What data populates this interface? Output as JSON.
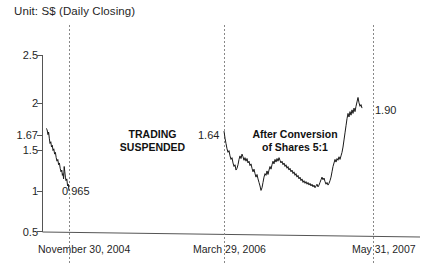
{
  "chart_data": {
    "type": "line",
    "title": "Unit: S$ (Daily Closing)",
    "xlabel": "",
    "ylabel": "",
    "ylim": [
      0.5,
      2.5
    ],
    "yticks": [
      0.5,
      1,
      1.5,
      1.67,
      2,
      2.5
    ],
    "ytick_labels": [
      "0.5",
      "1",
      "1.5",
      "1.67",
      "2",
      "2.5"
    ],
    "xtick_labels": [
      "November 30, 2004",
      "March 29, 2006",
      "May 31, 2007"
    ],
    "grid": false,
    "legend": "none",
    "vertical_markers": [
      {
        "label": "November 30, 2004",
        "x_px": 69
      },
      {
        "label": "March 29, 2006",
        "x_px": 224
      },
      {
        "label": "May 31, 2007",
        "x_px": 373
      }
    ],
    "annotations": [
      {
        "text": "TRADING SUSPENDED",
        "line1": "TRADING",
        "line2": "SUSPENDED",
        "bold": true
      },
      {
        "text": "After Conversion of Shares 5:1",
        "line1": "After Conversion",
        "line2": "of Shares 5:1",
        "bold": true
      },
      {
        "text": "0.965",
        "value": 0.965
      },
      {
        "text": "1.64",
        "value": 1.64
      },
      {
        "text": "1.90",
        "value": 1.9
      }
    ],
    "series": [
      {
        "name": "Pre-suspension (to November 30, 2004)",
        "start_value": 1.67,
        "end_value": 0.965,
        "points": [
          [
            46,
            1.67
          ],
          [
            47,
            1.66
          ],
          [
            48,
            1.6
          ],
          [
            48.6,
            1.63
          ],
          [
            49.3,
            1.56
          ],
          [
            50,
            1.5
          ],
          [
            50.8,
            1.52
          ],
          [
            51.5,
            1.46
          ],
          [
            52.3,
            1.48
          ],
          [
            53,
            1.42
          ],
          [
            53.8,
            1.44
          ],
          [
            54.6,
            1.38
          ],
          [
            55.4,
            1.4
          ],
          [
            56.2,
            1.34
          ],
          [
            57,
            1.3
          ],
          [
            57.8,
            1.32
          ],
          [
            58.6,
            1.26
          ],
          [
            59.4,
            1.28
          ],
          [
            60.2,
            1.22
          ],
          [
            61,
            1.18
          ],
          [
            61.8,
            1.2
          ],
          [
            62.4,
            1.14
          ],
          [
            63,
            1.16
          ],
          [
            63.6,
            1.1
          ],
          [
            64.2,
            1.24
          ],
          [
            64.8,
            1.18
          ],
          [
            65.4,
            1.12
          ],
          [
            66,
            1.08
          ],
          [
            66.8,
            1.1
          ],
          [
            67.6,
            1.02
          ],
          [
            68.3,
            1.04
          ],
          [
            69,
            0.965
          ]
        ]
      },
      {
        "name": "After Conversion of Shares 5:1 (March 29, 2006 - May 31, 2007)",
        "start_value": 1.64,
        "end_value": 1.9,
        "peak_value": 2.02,
        "points": [
          [
            224,
            1.64
          ],
          [
            225,
            1.56
          ],
          [
            226,
            1.5
          ],
          [
            227,
            1.44
          ],
          [
            228,
            1.4
          ],
          [
            229,
            1.42
          ],
          [
            230,
            1.36
          ],
          [
            231,
            1.32
          ],
          [
            232,
            1.34
          ],
          [
            233,
            1.28
          ],
          [
            234,
            1.24
          ],
          [
            235,
            1.26
          ],
          [
            236,
            1.2
          ],
          [
            237,
            1.22
          ],
          [
            238,
            1.26
          ],
          [
            239,
            1.32
          ],
          [
            240,
            1.36
          ],
          [
            241,
            1.33
          ],
          [
            242,
            1.38
          ],
          [
            243,
            1.35
          ],
          [
            244,
            1.31
          ],
          [
            245,
            1.34
          ],
          [
            246,
            1.3
          ],
          [
            247,
            1.33
          ],
          [
            248,
            1.28
          ],
          [
            249,
            1.3
          ],
          [
            250,
            1.25
          ],
          [
            251,
            1.27
          ],
          [
            252,
            1.22
          ],
          [
            253,
            1.18
          ],
          [
            254,
            1.21
          ],
          [
            255,
            1.16
          ],
          [
            256,
            1.12
          ],
          [
            257,
            1.15
          ],
          [
            258,
            1.1
          ],
          [
            259,
            1.06
          ],
          [
            260,
            1.02
          ],
          [
            261,
            0.97
          ],
          [
            262,
            1.0
          ],
          [
            263,
            1.06
          ],
          [
            264,
            1.12
          ],
          [
            265,
            1.16
          ],
          [
            266,
            1.14
          ],
          [
            267,
            1.19
          ],
          [
            268,
            1.15
          ],
          [
            269,
            1.2
          ],
          [
            270,
            1.24
          ],
          [
            271,
            1.21
          ],
          [
            272,
            1.26
          ],
          [
            273,
            1.3
          ],
          [
            274,
            1.27
          ],
          [
            275,
            1.32
          ],
          [
            276,
            1.29
          ],
          [
            277,
            1.33
          ],
          [
            278,
            1.3
          ],
          [
            279,
            1.34
          ],
          [
            280,
            1.31
          ],
          [
            281,
            1.28
          ],
          [
            282,
            1.3
          ],
          [
            283,
            1.26
          ],
          [
            284,
            1.28
          ],
          [
            285,
            1.24
          ],
          [
            286,
            1.26
          ],
          [
            287,
            1.22
          ],
          [
            288,
            1.24
          ],
          [
            289,
            1.2
          ],
          [
            290,
            1.22
          ],
          [
            291,
            1.18
          ],
          [
            292,
            1.2
          ],
          [
            293,
            1.16
          ],
          [
            294,
            1.18
          ],
          [
            295,
            1.14
          ],
          [
            296,
            1.16
          ],
          [
            297,
            1.12
          ],
          [
            298,
            1.14
          ],
          [
            299,
            1.1
          ],
          [
            300,
            1.12
          ],
          [
            301,
            1.08
          ],
          [
            302,
            1.1
          ],
          [
            303,
            1.06
          ],
          [
            304,
            1.08
          ],
          [
            305,
            1.05
          ],
          [
            306,
            1.07
          ],
          [
            307,
            1.04
          ],
          [
            308,
            1.06
          ],
          [
            309,
            1.03
          ],
          [
            310,
            1.05
          ],
          [
            311,
            1.02
          ],
          [
            312,
            1.04
          ],
          [
            313,
            1.01
          ],
          [
            314,
            1.03
          ],
          [
            315,
            1.0
          ],
          [
            316,
            1.02
          ],
          [
            317,
            1.04
          ],
          [
            318,
            1.01
          ],
          [
            319,
            1.03
          ],
          [
            320,
            1.06
          ],
          [
            321,
            1.09
          ],
          [
            322,
            1.12
          ],
          [
            323,
            1.09
          ],
          [
            324,
            1.11
          ],
          [
            325,
            1.07
          ],
          [
            326,
            1.04
          ],
          [
            327,
            1.06
          ],
          [
            328,
            1.03
          ],
          [
            329,
            1.05
          ],
          [
            330,
            1.08
          ],
          [
            331,
            1.12
          ],
          [
            332,
            1.18
          ],
          [
            333,
            1.24
          ],
          [
            334,
            1.28
          ],
          [
            335,
            1.32
          ],
          [
            336,
            1.29
          ],
          [
            337,
            1.33
          ],
          [
            338,
            1.31
          ],
          [
            339,
            1.35
          ],
          [
            340,
            1.32
          ],
          [
            341,
            1.36
          ],
          [
            342,
            1.4
          ],
          [
            343,
            1.46
          ],
          [
            344,
            1.54
          ],
          [
            345,
            1.62
          ],
          [
            346,
            1.7
          ],
          [
            347,
            1.78
          ],
          [
            348,
            1.84
          ],
          [
            349,
            1.8
          ],
          [
            350,
            1.86
          ],
          [
            351,
            1.82
          ],
          [
            352,
            1.88
          ],
          [
            353,
            1.84
          ],
          [
            354,
            1.9
          ],
          [
            355,
            1.86
          ],
          [
            356,
            1.92
          ],
          [
            357,
            1.97
          ],
          [
            358,
            2.02
          ],
          [
            359,
            1.96
          ],
          [
            360,
            1.92
          ],
          [
            361,
            1.94
          ],
          [
            362,
            1.9
          ]
        ]
      }
    ]
  },
  "axis": {
    "y_top_label": "2.5",
    "y_bottom_label": "0.5"
  }
}
